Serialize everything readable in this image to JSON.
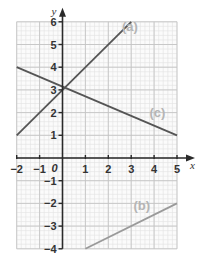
{
  "chart_data": {
    "type": "line",
    "title": "",
    "xlabel": "x",
    "ylabel": "y",
    "xlim": [
      -2,
      5
    ],
    "ylim": [
      -4,
      6
    ],
    "grid": true,
    "grid_minor_step": 0.2,
    "grid_major_step": 1,
    "x_ticks": [
      -2,
      -1,
      0,
      1,
      2,
      3,
      4,
      5
    ],
    "x_tick_labels": [
      "−2",
      "−1",
      "0",
      "1",
      "2",
      "3",
      "4",
      "5"
    ],
    "y_ticks": [
      -4,
      -3,
      -2,
      -1,
      1,
      2,
      3,
      4,
      5,
      6
    ],
    "y_tick_labels": [
      "−4",
      "−3",
      "−2",
      "−1",
      "1",
      "2",
      "3",
      "4",
      "5",
      "6"
    ],
    "origin_label": "0",
    "series": [
      {
        "name": "(a)",
        "equation": "y = x + 3",
        "x": [
          -2,
          3
        ],
        "y": [
          1,
          6
        ],
        "color": "#555555",
        "label_pos": [
          2.6,
          5.6
        ]
      },
      {
        "name": "(b)",
        "equation": "y = 0.5x - 4.5",
        "x": [
          1,
          5
        ],
        "y": [
          -4,
          -2
        ],
        "color": "#9a9a9a",
        "label_pos": [
          3.1,
          -2.3
        ]
      },
      {
        "name": "(c)",
        "equation": "y = -3x/7 + 22/7",
        "x": [
          -2,
          5
        ],
        "y": [
          4,
          1
        ],
        "color": "#555555",
        "label_pos": [
          3.8,
          1.8
        ]
      }
    ],
    "colors": {
      "grid_minor": "#e2e2e2",
      "grid_major": "#c4c4c4",
      "axis": "#2a2a2a",
      "label": "#b5b5b5"
    }
  }
}
